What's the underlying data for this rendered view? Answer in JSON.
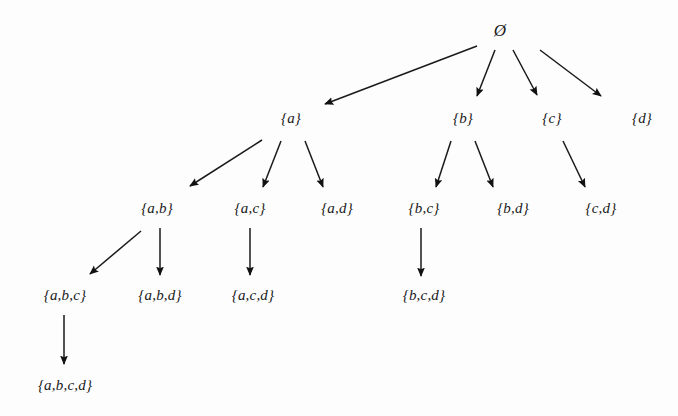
{
  "diagram": {
    "background_color": "#fdfdfd",
    "ink_color": "#1a1a1a",
    "width": 678,
    "height": 416,
    "nodes": [
      {
        "id": "empty",
        "label": "Ø",
        "x": 500,
        "y": 30,
        "level": 0,
        "root": true
      },
      {
        "id": "a",
        "label": "{a}",
        "x": 291,
        "y": 118,
        "level": 1,
        "root": false
      },
      {
        "id": "b",
        "label": "{b}",
        "x": 463,
        "y": 118,
        "level": 1,
        "root": false
      },
      {
        "id": "c",
        "label": "{c}",
        "x": 552,
        "y": 118,
        "level": 1,
        "root": false
      },
      {
        "id": "d",
        "label": "{d}",
        "x": 642,
        "y": 118,
        "level": 1,
        "root": false
      },
      {
        "id": "ab",
        "label": "{a,b}",
        "x": 157,
        "y": 208,
        "level": 2,
        "root": false
      },
      {
        "id": "ac",
        "label": "{a,c}",
        "x": 250,
        "y": 208,
        "level": 2,
        "root": false
      },
      {
        "id": "ad",
        "label": "{a,d}",
        "x": 337,
        "y": 208,
        "level": 2,
        "root": false
      },
      {
        "id": "bc",
        "label": "{b,c}",
        "x": 424,
        "y": 208,
        "level": 2,
        "root": false
      },
      {
        "id": "bd",
        "label": "{b,d}",
        "x": 513,
        "y": 208,
        "level": 2,
        "root": false
      },
      {
        "id": "cd",
        "label": "{c,d}",
        "x": 601,
        "y": 208,
        "level": 2,
        "root": false
      },
      {
        "id": "abc",
        "label": "{a,b,c}",
        "x": 65,
        "y": 295,
        "level": 3,
        "root": false
      },
      {
        "id": "abd",
        "label": "{a,b,d}",
        "x": 160,
        "y": 295,
        "level": 3,
        "root": false
      },
      {
        "id": "acd",
        "label": "{a,c,d}",
        "x": 253,
        "y": 295,
        "level": 3,
        "root": false
      },
      {
        "id": "bcd",
        "label": "{b,c,d}",
        "x": 424,
        "y": 295,
        "level": 3,
        "root": false
      },
      {
        "id": "abcd",
        "label": "{a,b,c,d}",
        "x": 65,
        "y": 385,
        "level": 4,
        "root": false
      }
    ],
    "edges": [
      {
        "id": "empty-a",
        "from": "empty",
        "to": "a",
        "x1": 477,
        "y1": 46,
        "x2": 325,
        "y2": 104
      },
      {
        "id": "empty-b",
        "from": "empty",
        "to": "b",
        "x1": 495,
        "y1": 50,
        "x2": 477,
        "y2": 96
      },
      {
        "id": "empty-c",
        "from": "empty",
        "to": "c",
        "x1": 513,
        "y1": 50,
        "x2": 537,
        "y2": 95
      },
      {
        "id": "empty-d",
        "from": "empty",
        "to": "d",
        "x1": 540,
        "y1": 50,
        "x2": 601,
        "y2": 96
      },
      {
        "id": "a-ab",
        "from": "a",
        "to": "ab",
        "x1": 262,
        "y1": 140,
        "x2": 190,
        "y2": 186
      },
      {
        "id": "a-ac",
        "from": "a",
        "to": "ac",
        "x1": 281,
        "y1": 141,
        "x2": 263,
        "y2": 187
      },
      {
        "id": "a-ad",
        "from": "a",
        "to": "ad",
        "x1": 305,
        "y1": 141,
        "x2": 323,
        "y2": 187
      },
      {
        "id": "b-bc",
        "from": "b",
        "to": "bc",
        "x1": 451,
        "y1": 141,
        "x2": 436,
        "y2": 187
      },
      {
        "id": "b-bd",
        "from": "b",
        "to": "bd",
        "x1": 475,
        "y1": 141,
        "x2": 493,
        "y2": 187
      },
      {
        "id": "c-cd",
        "from": "c",
        "to": "cd",
        "x1": 563,
        "y1": 141,
        "x2": 585,
        "y2": 187
      },
      {
        "id": "ab-abc",
        "from": "ab",
        "to": "abc",
        "x1": 141,
        "y1": 231,
        "x2": 90,
        "y2": 274
      },
      {
        "id": "ab-abd",
        "from": "ab",
        "to": "abd",
        "x1": 160,
        "y1": 228,
        "x2": 160,
        "y2": 275
      },
      {
        "id": "ac-acd",
        "from": "ac",
        "to": "acd",
        "x1": 250,
        "y1": 228,
        "x2": 250,
        "y2": 275
      },
      {
        "id": "bc-bcd",
        "from": "bc",
        "to": "bcd",
        "x1": 421,
        "y1": 228,
        "x2": 421,
        "y2": 276
      },
      {
        "id": "abc-abcd",
        "from": "abc",
        "to": "abcd",
        "x1": 64,
        "y1": 315,
        "x2": 64,
        "y2": 364
      }
    ]
  }
}
